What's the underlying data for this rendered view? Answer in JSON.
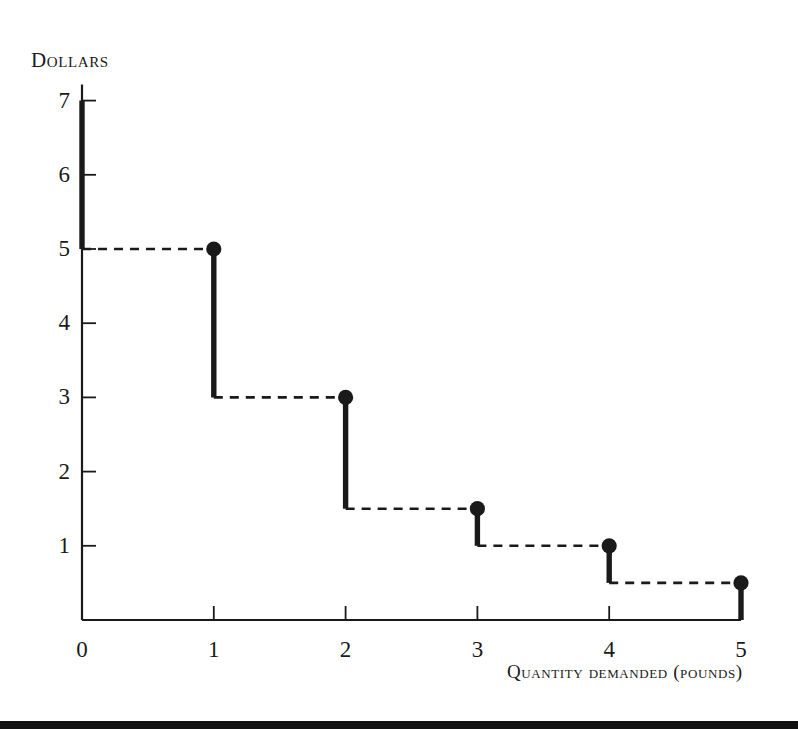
{
  "figure": {
    "background_color": "#ffffff",
    "ink_color": "#1a1a1a",
    "bottom_rule_color": "#111111"
  },
  "chart_data": {
    "type": "line",
    "subtype": "step-function-demand-schedule",
    "title": "",
    "xlabel": "Quantity demanded (pounds)",
    "ylabel": "Dollars",
    "xlim": [
      0,
      5
    ],
    "ylim": [
      0,
      7
    ],
    "grid": false,
    "legend": null,
    "x_ticks": [
      0,
      1,
      2,
      3,
      4,
      5
    ],
    "x_tick_labels": [
      "0",
      "1",
      "2",
      "3",
      "4",
      "5"
    ],
    "y_ticks": [
      1,
      2,
      3,
      4,
      5,
      6,
      7
    ],
    "y_tick_labels": [
      "1",
      "2",
      "3",
      "4",
      "5",
      "6",
      "7"
    ],
    "points": [
      {
        "x": 1,
        "y": 5
      },
      {
        "x": 2,
        "y": 3
      },
      {
        "x": 3,
        "y": 1.5
      },
      {
        "x": 4,
        "y": 1
      },
      {
        "x": 5,
        "y": 0.5
      }
    ],
    "vertical_segments": [
      {
        "x": 0,
        "y_top": 7,
        "y_bottom": 5,
        "has_marker": false
      },
      {
        "x": 1,
        "y_top": 5,
        "y_bottom": 3,
        "has_marker": true
      },
      {
        "x": 2,
        "y_top": 3,
        "y_bottom": 1.5,
        "has_marker": true
      },
      {
        "x": 3,
        "y_top": 1.5,
        "y_bottom": 1,
        "has_marker": true
      },
      {
        "x": 4,
        "y_top": 1,
        "y_bottom": 0.5,
        "has_marker": true
      },
      {
        "x": 5,
        "y_top": 0.5,
        "y_bottom": 0,
        "has_marker": true
      }
    ],
    "dashed_segments": [
      {
        "x_start": 0,
        "x_end": 1,
        "y": 5
      },
      {
        "x_start": 1,
        "x_end": 2,
        "y": 3
      },
      {
        "x_start": 2,
        "x_end": 3,
        "y": 1.5
      },
      {
        "x_start": 3,
        "x_end": 4,
        "y": 1
      },
      {
        "x_start": 4,
        "x_end": 5,
        "y": 0.5
      }
    ],
    "series": [
      {
        "name": "Demand",
        "x": [
          1,
          2,
          3,
          4,
          5
        ],
        "values": [
          5,
          3,
          1.5,
          1,
          0.5
        ]
      }
    ]
  },
  "axis_labels": {
    "y_title": "Dollars",
    "x_title": "Quantity demanded (pounds)"
  }
}
